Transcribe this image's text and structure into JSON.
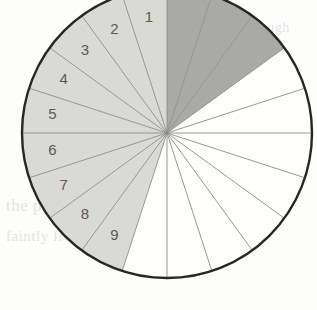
{
  "figure": {
    "type": "sector-diagram",
    "geometry": {
      "center_x": 167,
      "center_y": 133,
      "radius": 145,
      "sector_count": 20,
      "sector_angle_degrees": 18,
      "start_angle_degrees": -90,
      "direction": "counterclockwise-labels"
    },
    "colors": {
      "light_fill": "#d9d9d6",
      "dark_fill": "#a9a9a7",
      "white_fill": "#fefefd",
      "outline": "#262626",
      "spoke": "#8d8d8b",
      "label_text": "#5a5a5a",
      "background": "#fdfdfc"
    },
    "sectors": [
      {
        "index": 1,
        "label": "1",
        "fill": "light",
        "label_radius": 0.8,
        "mid_angle": -99
      },
      {
        "index": 2,
        "label": "2",
        "fill": "light",
        "label_radius": 0.8,
        "mid_angle": -117
      },
      {
        "index": 3,
        "label": "3",
        "fill": "light",
        "label_radius": 0.8,
        "mid_angle": -135
      },
      {
        "index": 4,
        "label": "4",
        "fill": "light",
        "label_radius": 0.8,
        "mid_angle": -153
      },
      {
        "index": 5,
        "label": "5",
        "fill": "light",
        "label_radius": 0.8,
        "mid_angle": -171
      },
      {
        "index": 6,
        "label": "6",
        "fill": "light",
        "label_radius": 0.8,
        "mid_angle": 171
      },
      {
        "index": 7,
        "label": "7",
        "fill": "light",
        "label_radius": 0.8,
        "mid_angle": 153
      },
      {
        "index": 8,
        "label": "8",
        "fill": "light",
        "label_radius": 0.8,
        "mid_angle": 135
      },
      {
        "index": 9,
        "label": "9",
        "fill": "light",
        "label_radius": 0.8,
        "mid_angle": 117
      },
      {
        "index": 10,
        "label": "",
        "fill": "white",
        "label_radius": 0.8,
        "mid_angle": 99
      },
      {
        "index": 11,
        "label": "",
        "fill": "white",
        "label_radius": 0.8,
        "mid_angle": 81
      },
      {
        "index": 12,
        "label": "",
        "fill": "white",
        "label_radius": 0.8,
        "mid_angle": 63
      },
      {
        "index": 13,
        "label": "",
        "fill": "white",
        "label_radius": 0.8,
        "mid_angle": 45
      },
      {
        "index": 14,
        "label": "",
        "fill": "white",
        "label_radius": 0.8,
        "mid_angle": 27
      },
      {
        "index": 15,
        "label": "",
        "fill": "white",
        "label_radius": 0.8,
        "mid_angle": 9
      },
      {
        "index": 16,
        "label": "",
        "fill": "white",
        "label_radius": 0.8,
        "mid_angle": -9
      },
      {
        "index": 17,
        "label": "",
        "fill": "white",
        "label_radius": 0.8,
        "mid_angle": -27
      },
      {
        "index": 18,
        "label": "",
        "fill": "dark",
        "label_radius": 0.8,
        "mid_angle": -45
      },
      {
        "index": 19,
        "label": "",
        "fill": "dark",
        "label_radius": 0.8,
        "mid_angle": -63
      },
      {
        "index": 20,
        "label": "",
        "fill": "dark",
        "label_radius": 0.8,
        "mid_angle": -81
      }
    ],
    "visible_labels": [
      "1",
      "2",
      "3",
      "4",
      "5",
      "6",
      "7",
      "8",
      "9"
    ]
  },
  "background_bleed": {
    "line_1": "the   printed   text   shows   through",
    "line_2": "faintly  from  the  reverse  of  the  page",
    "line_3": "bleed   through"
  }
}
